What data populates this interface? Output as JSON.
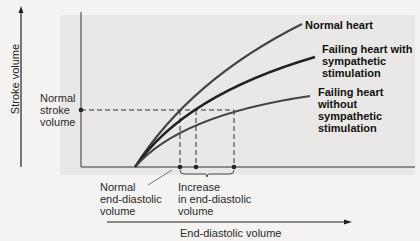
{
  "figure": {
    "y_axis_label": "Stroke volume",
    "x_axis_label": "End-diastolic volume",
    "annotations": {
      "normal_stroke_volume": [
        "Normal",
        "stroke",
        "volume"
      ],
      "normal_edv": [
        "Normal",
        "end-diastolic",
        "volume"
      ],
      "increase_edv": [
        "Increase",
        "in end-diastolic",
        "volume"
      ]
    },
    "curves": [
      {
        "label": [
          "Normal heart"
        ],
        "color": "#3a3a3a"
      },
      {
        "label": [
          "Failing heart with",
          "sympathetic",
          "stimulation"
        ],
        "color": "#2a2a2a"
      },
      {
        "label": [
          "Failing heart",
          "without",
          "sympathetic",
          "stimulation"
        ],
        "color": "#3a3a3a"
      }
    ]
  }
}
